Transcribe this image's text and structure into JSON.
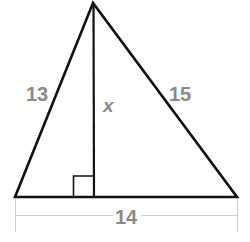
{
  "diagram": {
    "type": "triangle-with-altitude",
    "colors": {
      "stroke": "#111111",
      "label": "#8a8a8a",
      "dimension_line": "#cfcfcf",
      "background": "#ffffff"
    },
    "vertices": {
      "apex": [
        93,
        3
      ],
      "bottom_left": [
        15,
        197
      ],
      "bottom_right": [
        237,
        197
      ],
      "altitude_foot": [
        94,
        197
      ]
    },
    "labels": {
      "left_side": "13",
      "right_side": "15",
      "altitude": "x",
      "base": "14"
    },
    "right_angle_marker": {
      "x": 73,
      "y": 176,
      "size": 21
    }
  }
}
